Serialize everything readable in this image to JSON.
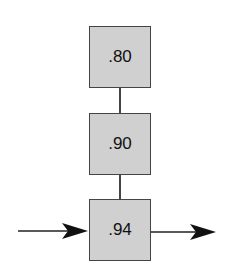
{
  "diagram": {
    "boxes": [
      {
        "label": ".80"
      },
      {
        "label": ".90"
      },
      {
        "label": ".94"
      }
    ],
    "input_arrow": "incoming-arrow",
    "output_arrow": "outgoing-arrow",
    "colors": {
      "box_fill": "#d0d0d0",
      "stroke": "#444444"
    }
  }
}
